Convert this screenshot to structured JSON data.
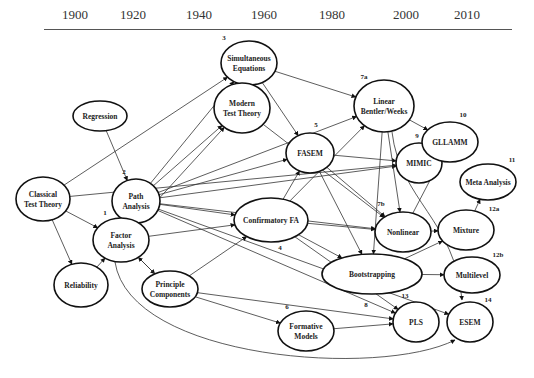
{
  "timeline": {
    "years": [
      {
        "label": "1900",
        "x": 62
      },
      {
        "label": "1920",
        "x": 120
      },
      {
        "label": "1940",
        "x": 186
      },
      {
        "label": "1960",
        "x": 251
      },
      {
        "label": "1980",
        "x": 319
      },
      {
        "label": "2000",
        "x": 393
      },
      {
        "label": "2010",
        "x": 454
      }
    ]
  },
  "nodes": {
    "regression": {
      "lines": [
        "Regression"
      ],
      "num": ""
    },
    "classical": {
      "lines": [
        "Classical",
        "Test Theory"
      ],
      "num": ""
    },
    "path": {
      "lines": [
        "Path",
        "Analysis"
      ],
      "num": "2"
    },
    "factor": {
      "lines": [
        "Factor",
        "Analysis"
      ],
      "num": "1"
    },
    "reliability": {
      "lines": [
        "Reliability"
      ],
      "num": ""
    },
    "principle": {
      "lines": [
        "Principle",
        "Components"
      ],
      "num": ""
    },
    "simultaneous": {
      "lines": [
        "Simultaneous",
        "Equations"
      ],
      "num": "3"
    },
    "modern": {
      "lines": [
        "Modern",
        "Test Theory"
      ],
      "num": ""
    },
    "fasem": {
      "lines": [
        "FASEM"
      ],
      "num": "5"
    },
    "cfa": {
      "lines": [
        "Confirmatory FA"
      ],
      "num": "4"
    },
    "formative": {
      "lines": [
        "Formative",
        "Models"
      ],
      "num": "6"
    },
    "linear": {
      "lines": [
        "Linear",
        "Bentler/Weeks"
      ],
      "num": "7a"
    },
    "mimic": {
      "lines": [
        "MIMIC"
      ],
      "num": "9"
    },
    "gllamm": {
      "lines": [
        "GLLAMM"
      ],
      "num": "10"
    },
    "nonlinear": {
      "lines": [
        "Nonlinear"
      ],
      "num": "7b"
    },
    "bootstrapping": {
      "lines": [
        "Bootstrapping"
      ],
      "num": "8"
    },
    "meta": {
      "lines": [
        "Meta Analysis"
      ],
      "num": "11"
    },
    "mixture": {
      "lines": [
        "Mixture"
      ],
      "num": "12a"
    },
    "multilevel": {
      "lines": [
        "Multilevel"
      ],
      "num": "12b"
    },
    "pls": {
      "lines": [
        "PLS"
      ],
      "num": "13"
    },
    "esem": {
      "lines": [
        "ESEM"
      ],
      "num": "14"
    }
  },
  "edges": [
    [
      "regression",
      "path"
    ],
    [
      "classical",
      "factor"
    ],
    [
      "classical",
      "reliability"
    ],
    [
      "classical",
      "mimic"
    ],
    [
      "classical",
      "simultaneous"
    ],
    [
      "reliability",
      "factor"
    ],
    [
      "factor",
      "principle"
    ],
    [
      "principle",
      "factor"
    ],
    [
      "factor",
      "cfa"
    ],
    [
      "factor",
      "modern"
    ],
    [
      "factor",
      "esem"
    ],
    [
      "path",
      "simultaneous"
    ],
    [
      "path",
      "modern"
    ],
    [
      "path",
      "fasem"
    ],
    [
      "path",
      "linear"
    ],
    [
      "path",
      "mimic"
    ],
    [
      "path",
      "cfa"
    ],
    [
      "path",
      "nonlinear"
    ],
    [
      "path",
      "pls"
    ],
    [
      "path",
      "esem"
    ],
    [
      "principle",
      "cfa"
    ],
    [
      "principle",
      "formative"
    ],
    [
      "principle",
      "pls"
    ],
    [
      "simultaneous",
      "fasem"
    ],
    [
      "simultaneous",
      "linear"
    ],
    [
      "modern",
      "nonlinear"
    ],
    [
      "fasem",
      "nonlinear"
    ],
    [
      "fasem",
      "bootstrapping"
    ],
    [
      "fasem",
      "mimic"
    ],
    [
      "cfa",
      "fasem"
    ],
    [
      "cfa",
      "linear"
    ],
    [
      "cfa",
      "nonlinear"
    ],
    [
      "cfa",
      "bootstrapping"
    ],
    [
      "linear",
      "gllamm"
    ],
    [
      "linear",
      "nonlinear"
    ],
    [
      "linear",
      "bootstrapping"
    ],
    [
      "linear",
      "esem"
    ],
    [
      "nonlinear",
      "mixture"
    ],
    [
      "nonlinear",
      "gllamm"
    ],
    [
      "bootstrapping",
      "mixture"
    ],
    [
      "bootstrapping",
      "multilevel"
    ],
    [
      "mixture",
      "meta"
    ],
    [
      "formative",
      "pls"
    ],
    [
      "cfa",
      "pls"
    ]
  ]
}
